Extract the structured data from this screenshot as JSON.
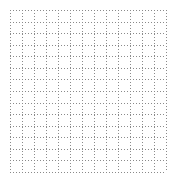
{
  "grid": {
    "columns": 13,
    "rows": 14,
    "left": 10,
    "top": 10,
    "width": 156,
    "height": 162,
    "line_color": "#8a8a8a",
    "background": "#ffffff",
    "line_style": "dotted"
  }
}
